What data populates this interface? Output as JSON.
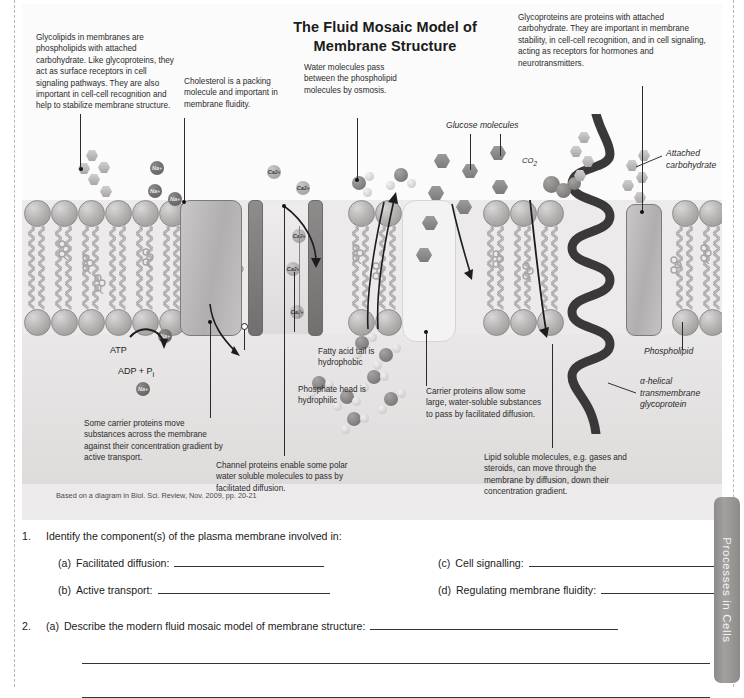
{
  "document": {
    "title": "The Fluid Mosaic Model of Membrane Structure",
    "caption": "Based on a diagram in Biol. Sci. Review, Nov. 2009, pp. 20-21",
    "side_tab": "Processes in Cells"
  },
  "annotations": {
    "glycolipids": "Glycolipids in membranes are phospholipids with attached carbohydrate. Like glycoproteins, they act as surface receptors in cell signaling pathways. They are also important in cell-cell recognition and help to stabilize membrane structure.",
    "cholesterol": "Cholesterol is a packing molecule and important in membrane fluidity.",
    "water": "Water molecules pass between the phospholipid molecules by osmosis.",
    "glycoproteins": "Glycoproteins are proteins with attached carbohydrate. They are important in membrane stability, in cell-cell recognition, and in cell signaling, acting as receptors for hormones and neurotransmitters.",
    "active_transport": "Some carrier proteins move substances across the membrane against their concentration gradient by active transport.",
    "channel_proteins": "Channel proteins enable some polar water soluble molecules to pass by facilitated diffusion.",
    "fatty_acid_tail": "Fatty acid tail is hydrophobic",
    "phosphate_head": "Phosphate head is hydrophilic",
    "carrier_proteins": "Carrier proteins allow some large, water-soluble substances to pass by facilitated diffusion.",
    "lipid_soluble": "Lipid soluble molecules, e.g. gases and  steroids, can move through the membrane by diffusion, down their concentration gradient.",
    "glucose_molecules": "Glucose molecules",
    "attached_carbohydrate": "Attached carbohydrate",
    "phospholipid": "Phospholipid",
    "alpha_helical": "α-helical transmembrane glycoprotein"
  },
  "molecule_labels": {
    "atp": "ATP",
    "adp": "ADP + P",
    "adp_sub": "i",
    "co2": "CO",
    "co2_sub": "2",
    "sodium": "Na⁺",
    "calcium": "Ca²⁺"
  },
  "questions": [
    {
      "number": "1.",
      "stem": "Identify the component(s) of the plasma membrane involved in:",
      "parts": [
        {
          "label": "(a)",
          "text": "Facilitated diffusion:"
        },
        {
          "label": "(c)",
          "text": "Cell signalling:"
        },
        {
          "label": "(b)",
          "text": "Active transport:"
        },
        {
          "label": "(d)",
          "text": "Regulating membrane fluidity:"
        }
      ]
    },
    {
      "number": "2.",
      "stem_label": "(a)",
      "stem": "Describe the modern fluid mosaic model of membrane structure:"
    }
  ],
  "colors": {
    "panel_bg": "#eceaea",
    "membrane_head": "#b8b5b5",
    "protein": "#b0aeae",
    "channel": "#726f6f",
    "helix": "#3a3838",
    "text": "#231f20"
  }
}
